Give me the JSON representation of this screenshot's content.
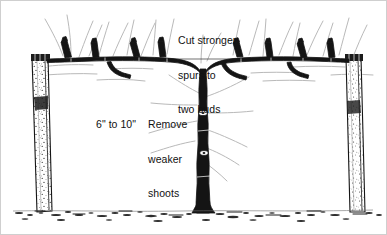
{
  "figure": {
    "background_color": "#ffffff",
    "ink_color": "#111111",
    "faint_shoot_color": "#b9b9b9",
    "border_color": "#cfcfcf",
    "width": 387,
    "height": 235
  },
  "annotations": {
    "cut_spurs": {
      "line1": "Cut stronger",
      "line2": "spurs to",
      "line3": "two buds"
    },
    "spacing": {
      "text": "6\" to 10\""
    },
    "remove_weak": {
      "line1": "Remove",
      "line2": "weaker",
      "line3": "shoots"
    }
  },
  "scene": {
    "left_post_name": "left trellis post",
    "right_post_name": "right trellis post",
    "trunk_name": "grapevine trunk",
    "cordon_name": "horizontal cordon wire arm",
    "ground_name": "soil line with debris",
    "spur_count_left": 5,
    "spur_count_right": 5
  }
}
